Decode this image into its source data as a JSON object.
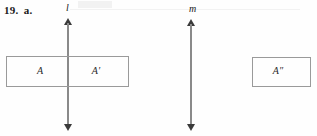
{
  "exercise": {
    "number": "19.",
    "part": "a."
  },
  "lines": [
    {
      "name": "line-l",
      "label": "l",
      "x": 68,
      "top": 18,
      "bottom": 131
    },
    {
      "name": "line-m",
      "label": "m",
      "x": 191,
      "top": 19,
      "bottom": 131
    }
  ],
  "figures": [
    {
      "name": "figure-left",
      "x": 6,
      "y": 56,
      "width": 123,
      "height": 31,
      "regions": [
        {
          "label": "A",
          "x": 40
        },
        {
          "label": "A′",
          "x": 96
        }
      ]
    },
    {
      "name": "figure-right",
      "x": 252,
      "y": 57,
      "width": 59,
      "height": 30,
      "regions": [
        {
          "label": "A″",
          "x": 278
        }
      ]
    }
  ],
  "colors": {
    "ink": "#1a1a1a",
    "rule": "#9a9a9a",
    "arrow": "#3a3a3a",
    "background": "#fefefe"
  }
}
